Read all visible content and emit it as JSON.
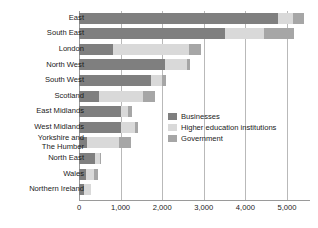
{
  "chart_data": {
    "type": "bar",
    "orientation": "horizontal",
    "stacked": true,
    "title": "",
    "xlabel": "",
    "ylabel": "",
    "xlim": [
      0,
      5530
    ],
    "grid": true,
    "legend_position": "inside-right-middle",
    "xticks": [
      "0",
      "1,000",
      "2,000",
      "3,000",
      "4,000",
      "5,000"
    ],
    "xtick_values": [
      0,
      1000,
      2000,
      3000,
      4000,
      5000
    ],
    "categories": [
      "East",
      "South East",
      "London",
      "North West",
      "South West",
      "Scotland",
      "East Midlands",
      "West Midlands",
      "Yorkshire and\nThe Humber",
      "North East",
      "Wales",
      "Northern Ireland"
    ],
    "series": [
      {
        "name": "Businesses",
        "color": "#7f7f7f",
        "values": [
          4790,
          3500,
          820,
          2060,
          1740,
          470,
          1010,
          1010,
          200,
          380,
          180,
          130
        ]
      },
      {
        "name": "Higher education institutions",
        "color": "#d9d9d9",
        "values": [
          360,
          960,
          1820,
          530,
          250,
          1060,
          160,
          330,
          760,
          130,
          180,
          150
        ]
      },
      {
        "name": "Government",
        "color": "#a6a6a6",
        "values": [
          250,
          700,
          290,
          90,
          110,
          290,
          110,
          70,
          300,
          30,
          100,
          0
        ]
      }
    ],
    "totals": [
      5400,
      5160,
      2930,
      2680,
      2100,
      1820,
      1280,
      1410,
      1260,
      540,
      460,
      280
    ]
  },
  "legend": {
    "items": [
      {
        "label": "Businesses",
        "color": "#7f7f7f"
      },
      {
        "label": "Higher education institutions",
        "color": "#d9d9d9"
      },
      {
        "label": "Government",
        "color": "#a6a6a6"
      }
    ]
  },
  "colors": {
    "businesses": "#7f7f7f",
    "higher_education": "#d9d9d9",
    "government": "#a6a6a6",
    "gridline": "#b9b9b9",
    "axis": "#9a9a9a",
    "text": "#1a1a1a",
    "background": "#ffffff"
  }
}
